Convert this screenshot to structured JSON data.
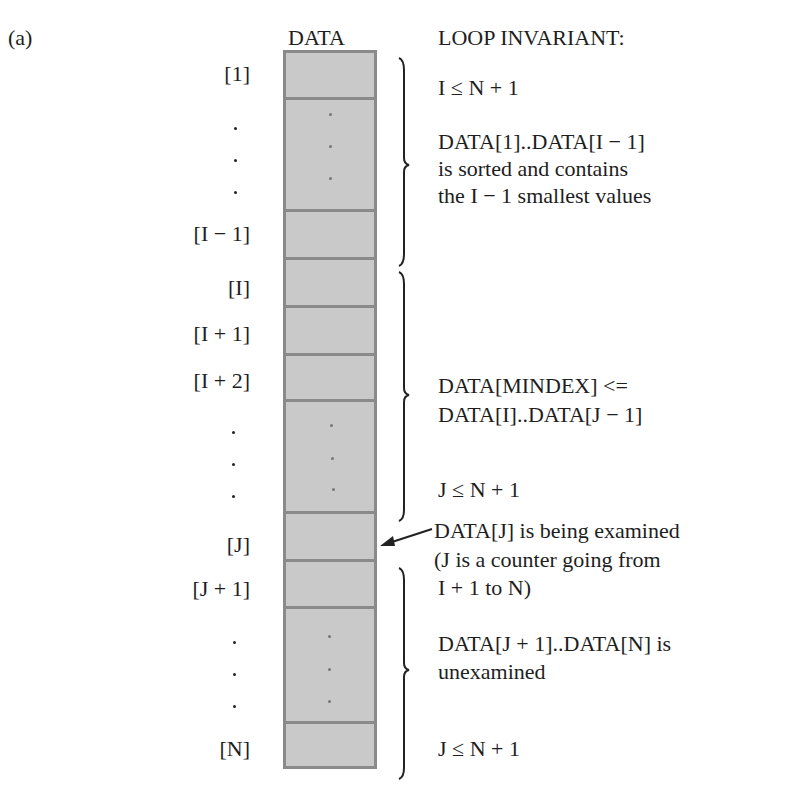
{
  "figure": {
    "panel_label": "(a)",
    "array_title": "DATA",
    "invariant_title": "LOOP INVARIANT:"
  },
  "index_labels": [
    "[1]",
    "[I − 1]",
    "[I]",
    "[I + 1]",
    "[I + 2]",
    "[J]",
    "[J + 1]",
    "[N]"
  ],
  "annotations": {
    "sorted_region": {
      "line1": "I ≤ N + 1",
      "line2": "DATA[1]..DATA[I − 1]",
      "line3": "is sorted and contains",
      "line4": "the I − 1 smallest values"
    },
    "min_region": {
      "line1": "DATA[MINDEX] <=",
      "line2": "DATA[I]..DATA[J − 1]",
      "line3": "J ≤ N + 1"
    },
    "current": {
      "line1": "DATA[J] is being examined",
      "line2": "(J is a counter going from",
      "line3": "I + 1 to N)"
    },
    "unexamined_region": {
      "line1": "DATA[J + 1]..DATA[N] is",
      "line2": "unexamined",
      "line3": "J ≤ N + 1"
    }
  },
  "colors": {
    "cell_fill": "#c9c9c9",
    "cell_border": "#8a8a8a",
    "ink": "#1e1e1e"
  }
}
